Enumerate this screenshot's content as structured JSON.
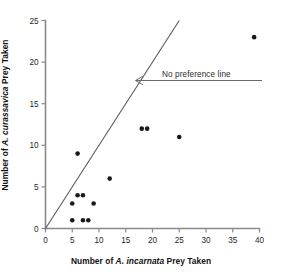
{
  "chart_data": {
    "type": "scatter",
    "title": "",
    "xlabel": "Number of A. incarnata Prey Taken",
    "ylabel": "Number of A. curassavica Prey Taken",
    "xlabel_parts": {
      "prefix": "Number of ",
      "species": "A. incarnata",
      "suffix": " Prey Taken"
    },
    "ylabel_parts": {
      "prefix": "Number of ",
      "species": "A. curassavica",
      "suffix": " Prey Taken"
    },
    "xlim": [
      0,
      40
    ],
    "ylim": [
      0,
      25
    ],
    "xticks": [
      0,
      5,
      10,
      15,
      20,
      25,
      30,
      35,
      40
    ],
    "yticks": [
      0,
      5,
      10,
      15,
      20,
      25
    ],
    "grid": false,
    "legend": false,
    "points": [
      {
        "x": 5,
        "y": 1
      },
      {
        "x": 7,
        "y": 1
      },
      {
        "x": 8,
        "y": 1
      },
      {
        "x": 5,
        "y": 3
      },
      {
        "x": 9,
        "y": 3
      },
      {
        "x": 6,
        "y": 4
      },
      {
        "x": 7,
        "y": 4
      },
      {
        "x": 6,
        "y": 9
      },
      {
        "x": 12,
        "y": 6
      },
      {
        "x": 18,
        "y": 12
      },
      {
        "x": 19,
        "y": 12
      },
      {
        "x": 25,
        "y": 11
      },
      {
        "x": 39,
        "y": 23
      }
    ],
    "reference_line": {
      "label": "No preference line",
      "slope": 1,
      "intercept": 0,
      "x_start": 0,
      "x_end": 25,
      "y_start": 0,
      "y_end": 25
    },
    "annotation": {
      "text": "No preference line",
      "arrow_direction": "left",
      "arrow_tip_x": 16.8,
      "arrow_tip_y": 17.0
    }
  },
  "colors": {
    "point": "#1a1a1a",
    "axis": "#8a8a8a",
    "reference_line": "#5a5a5a",
    "annotation": "#6a6a6a",
    "background": "#ffffff"
  }
}
